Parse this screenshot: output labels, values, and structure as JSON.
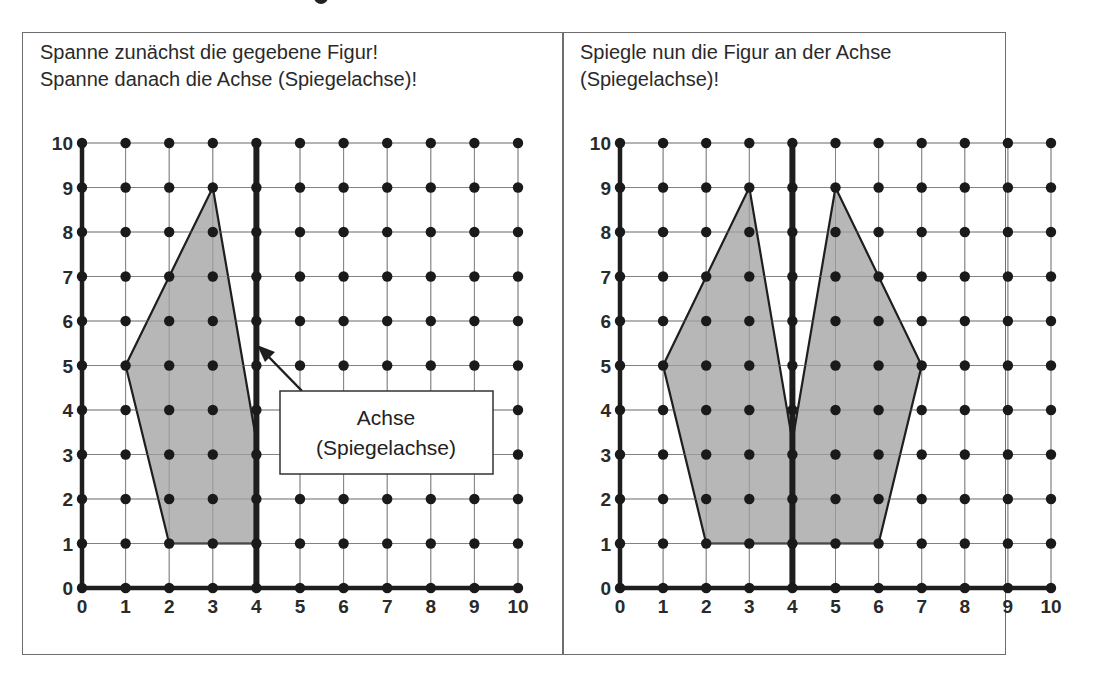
{
  "panels": [
    {
      "id": "left",
      "instructions": [
        "Spanne zunächst die gegebene Figur!",
        "Spanne danach die Achse (Spiegelachse)!"
      ],
      "grid": {
        "x_min": 0,
        "x_max": 10,
        "y_min": 0,
        "y_max": 10
      },
      "axis_of_symmetry_x": 4,
      "figure_vertices": [
        [
          1,
          5
        ],
        [
          3,
          9
        ],
        [
          4,
          3.3
        ],
        [
          4,
          1
        ],
        [
          2,
          1
        ]
      ],
      "callout": {
        "line1": "Achse",
        "line2": "(Spiegelachse)"
      }
    },
    {
      "id": "right",
      "instructions": [
        "Spiegle nun die Figur an der Achse",
        "(Spiegelachse)!"
      ],
      "grid": {
        "x_min": 0,
        "x_max": 10,
        "y_min": 0,
        "y_max": 10
      },
      "axis_of_symmetry_x": 4,
      "figure_vertices": [
        [
          1,
          5
        ],
        [
          3,
          9
        ],
        [
          4,
          3.3
        ],
        [
          5,
          9
        ],
        [
          7,
          5
        ],
        [
          6,
          1
        ],
        [
          2,
          1
        ]
      ]
    }
  ],
  "tick_labels": [
    "0",
    "1",
    "2",
    "3",
    "4",
    "5",
    "6",
    "7",
    "8",
    "9",
    "10"
  ],
  "colors": {
    "fill": "#b3b3b3",
    "stroke": "#1e1e1e",
    "grid": "#8a8a8a",
    "frame": "#6e6e6e"
  }
}
